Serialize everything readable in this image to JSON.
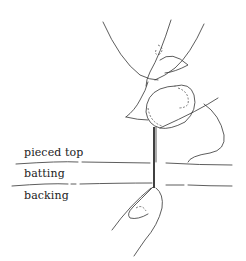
{
  "diagram": {
    "layers": [
      {
        "id": "top",
        "label": "pieced top"
      },
      {
        "id": "batting",
        "label": "batting"
      },
      {
        "id": "backing",
        "label": "backing"
      }
    ],
    "colors": {
      "line": "#333333",
      "needle": "#111111",
      "background": "#ffffff"
    }
  }
}
